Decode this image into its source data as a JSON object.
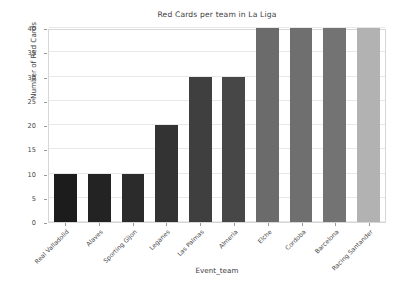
{
  "chart_data": {
    "type": "bar",
    "title": "Red Cards per team in La Liga",
    "xlabel": "Event_team",
    "ylabel": "Number of Red Cards",
    "categories": [
      "Real Valladolid",
      "Alaves",
      "Sporting Gijon",
      "Leganes",
      "Las Palmas",
      "Almeria",
      "Elche",
      "Cordoba",
      "Barcelona",
      "Racing Santander"
    ],
    "values": [
      10,
      10,
      10,
      20,
      30,
      30,
      40,
      40,
      40,
      40
    ],
    "ylim": [
      0,
      40
    ],
    "yticks": [
      0,
      5,
      10,
      15,
      20,
      25,
      30,
      35,
      40
    ],
    "ytick_labels": [
      "0",
      "5",
      "10",
      "15",
      "20",
      "25",
      "30",
      "35",
      "40"
    ],
    "grid": true,
    "grid_axis": "y",
    "legend": false,
    "legend_position": "none",
    "bar_colors": [
      "#1c1c1c",
      "#232323",
      "#2b2b2b",
      "#333333",
      "#3f3f3f",
      "#474747",
      "#6b6b6b",
      "#6f6f6f",
      "#737373",
      "#b2b2b2"
    ],
    "xtick_rotation": -45,
    "axes_facecolor": "#ffffff",
    "figure_facecolor": "#ffffff",
    "grid_color": "#e8e8e8",
    "spine_color": "#d6d6d6",
    "text_color": "#3c3c3c"
  }
}
